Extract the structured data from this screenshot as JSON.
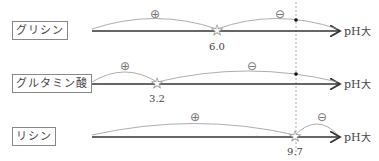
{
  "diagram": {
    "axis_label": "pH",
    "axis_label_marker": "大",
    "rows": [
      {
        "name": "グリシン",
        "pI": "6.0",
        "plus": "⊕",
        "minus": "⊖"
      },
      {
        "name": "グルタミン酸",
        "pI": "3.2",
        "plus": "⊕",
        "minus": "⊖"
      },
      {
        "name": "リシン",
        "pI": "9.7",
        "plus": "⊕",
        "minus": "⊖"
      }
    ],
    "reference_line": {
      "style": "dashed",
      "description": "vertical reference pH"
    }
  }
}
